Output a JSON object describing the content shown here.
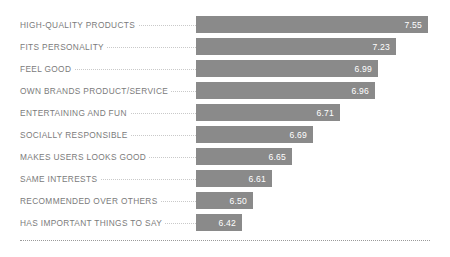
{
  "chart_data": {
    "type": "bar",
    "orientation": "horizontal",
    "title": "",
    "subtitle": "",
    "xlabel": "",
    "ylabel": "",
    "grid": false,
    "legend": null,
    "value_label_position": "inside-end",
    "categories": [
      "HIGH-QUALITY PRODUCTS",
      "FITS PERSONALITY",
      "FEEL GOOD",
      "OWN BRANDS PRODUCT/SERVICE",
      "ENTERTAINING AND FUN",
      "SOCIALLY RESPONSIBLE",
      "MAKES USERS LOOKS GOOD",
      "SAME INTERESTS",
      "RECOMMENDED OVER OTHERS",
      "HAS IMPORTANT THINGS TO SAY"
    ],
    "values": [
      7.55,
      7.23,
      6.99,
      6.96,
      6.71,
      6.69,
      6.65,
      6.61,
      6.5,
      6.42
    ],
    "value_labels": [
      "7.55",
      "7.23",
      "6.99",
      "6.96",
      "6.71",
      "6.69",
      "6.65",
      "6.61",
      "6.50",
      "6.42"
    ],
    "bar_pixel_widths": [
      232,
      200,
      182,
      179,
      144,
      117,
      96,
      76,
      57,
      46
    ],
    "bar_color": "#8a8a8a",
    "value_text_color": "#ffffff",
    "label_text_color": "#7b7b7b",
    "background_color": "#ffffff",
    "leader_line_color": "#c9c9c9",
    "footer_rule_color": "#9a9a9a"
  },
  "rows": [
    {
      "label": "HIGH-QUALITY PRODUCTS",
      "value": "7.55",
      "width": "232px"
    },
    {
      "label": "FITS PERSONALITY",
      "value": "7.23",
      "width": "200px"
    },
    {
      "label": "FEEL GOOD",
      "value": "6.99",
      "width": "182px"
    },
    {
      "label": "OWN BRANDS PRODUCT/SERVICE",
      "value": "6.96",
      "width": "179px"
    },
    {
      "label": "ENTERTAINING AND FUN",
      "value": "6.71",
      "width": "144px"
    },
    {
      "label": "SOCIALLY RESPONSIBLE",
      "value": "6.69",
      "width": "117px"
    },
    {
      "label": "MAKES USERS LOOKS GOOD",
      "value": "6.65",
      "width": "96px"
    },
    {
      "label": "SAME INTERESTS",
      "value": "6.61",
      "width": "76px"
    },
    {
      "label": "RECOMMENDED OVER OTHERS",
      "value": "6.50",
      "width": "57px"
    },
    {
      "label": "HAS IMPORTANT THINGS TO SAY",
      "value": "6.42",
      "width": "46px"
    }
  ]
}
